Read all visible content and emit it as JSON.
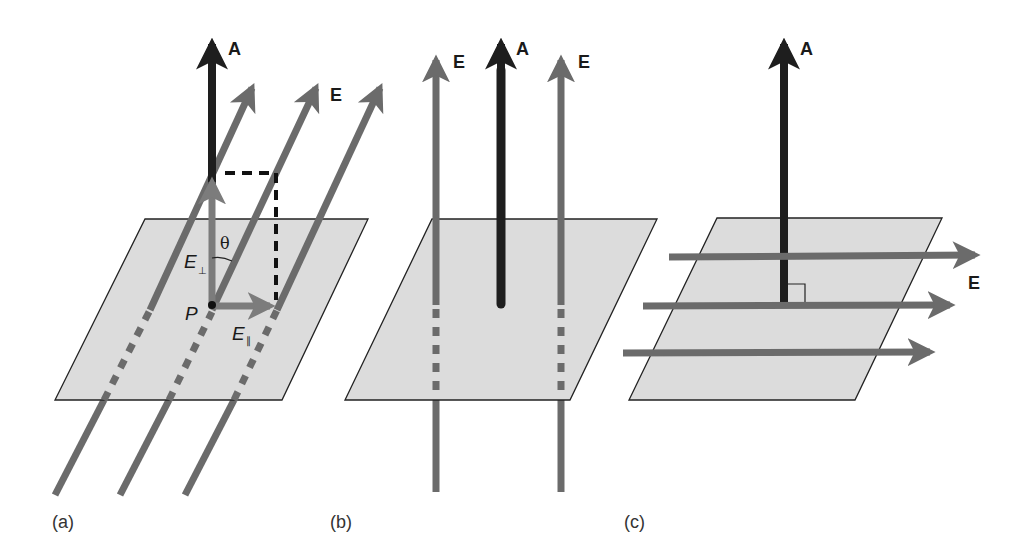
{
  "figure": {
    "colors": {
      "background": "#ffffff",
      "plane_fill": "#dcdcdc",
      "plane_stroke": "#222222",
      "area_vector": "#1e1e1e",
      "field_lines": "#6b6b6b",
      "projection_lines": "#111111"
    },
    "panels": [
      {
        "id": "a",
        "label": "(a)",
        "area_vector_label": "A",
        "field_label": "E",
        "point_label": "P",
        "angle_label": "θ",
        "perp_component": {
          "symbol": "E",
          "subscript": "⊥"
        },
        "parallel_component": {
          "symbol": "E",
          "subscript": "∥"
        },
        "description": "Uniform field lines E crossing the surface at angle θ to area vector A; E decomposed into perpendicular and parallel components at point P"
      },
      {
        "id": "b",
        "label": "(b)",
        "area_vector_label": "A",
        "field_labels": [
          "E",
          "E"
        ],
        "description": "Field lines E parallel to area vector A (perpendicular to surface)"
      },
      {
        "id": "c",
        "label": "(c)",
        "area_vector_label": "A",
        "field_label": "E",
        "right_angle_marker": true,
        "description": "Field lines E parallel to the surface, perpendicular to area vector A"
      }
    ]
  }
}
